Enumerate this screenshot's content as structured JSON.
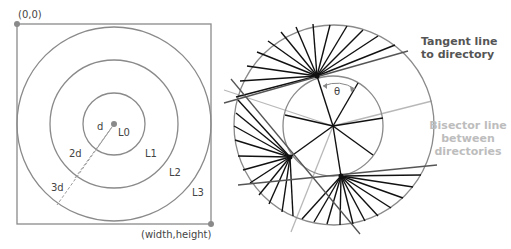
{
  "left_diagram": {
    "origin_label": "(0,0)",
    "corner_label": "(width,height)",
    "level_labels": [
      "L0",
      "L1",
      "L2",
      "L3"
    ],
    "distance_labels": [
      "d",
      "2d",
      "3d"
    ]
  },
  "right_diagram": {
    "angle_label": "θ",
    "tangent_annotation": [
      "Tangent line",
      "to directory"
    ],
    "bisector_annotation": [
      "Bisector line",
      "between",
      "directories"
    ]
  },
  "colors": {
    "outline": "#8a8a8a",
    "spoke": "#111111",
    "tangent": "#555555",
    "bisector": "#b8b8b8",
    "tangent_text": "#555555",
    "bisector_text": "#bdbdbd",
    "dot": "#8a8a8a"
  }
}
